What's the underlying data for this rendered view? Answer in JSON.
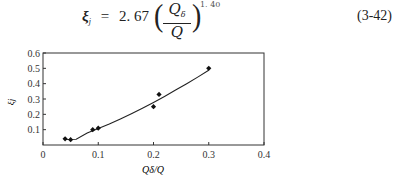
{
  "equation": {
    "lhs": "ξ",
    "lhs_sub": "j",
    "equals": "=",
    "coefficient": "2. 67",
    "numerator": "Q",
    "numerator_sub": "δ",
    "denominator": "Q",
    "exponent": "1. 40",
    "number": "(3-42)"
  },
  "chart_data": {
    "type": "scatter",
    "title": "",
    "xlabel": "Qδ/Q",
    "ylabel": "ξj",
    "xlim": [
      0,
      0.4
    ],
    "ylim": [
      0,
      0.6
    ],
    "xticks": [
      "0",
      "0.1",
      "0.2",
      "0.3",
      "0.4"
    ],
    "yticks": [
      "0.1",
      "0.2",
      "0.3",
      "0.4",
      "0.5",
      "0.6"
    ],
    "grid": false,
    "legend": null,
    "series": [
      {
        "name": "measured",
        "marker": "diamond",
        "x": [
          0.04,
          0.05,
          0.09,
          0.1,
          0.2,
          0.21,
          0.3
        ],
        "y": [
          0.04,
          0.035,
          0.1,
          0.11,
          0.25,
          0.33,
          0.5
        ]
      },
      {
        "name": "fit ξj = 2.67 (Qδ/Q)^1.40",
        "type": "line",
        "x": [
          0.04,
          0.06,
          0.08,
          0.1,
          0.12,
          0.14,
          0.16,
          0.18,
          0.2,
          0.22,
          0.24,
          0.26,
          0.28,
          0.3
        ],
        "y": [
          0.036,
          0.038,
          0.078,
          0.107,
          0.137,
          0.17,
          0.204,
          0.24,
          0.278,
          0.317,
          0.358,
          0.4,
          0.443,
          0.487
        ]
      }
    ]
  }
}
